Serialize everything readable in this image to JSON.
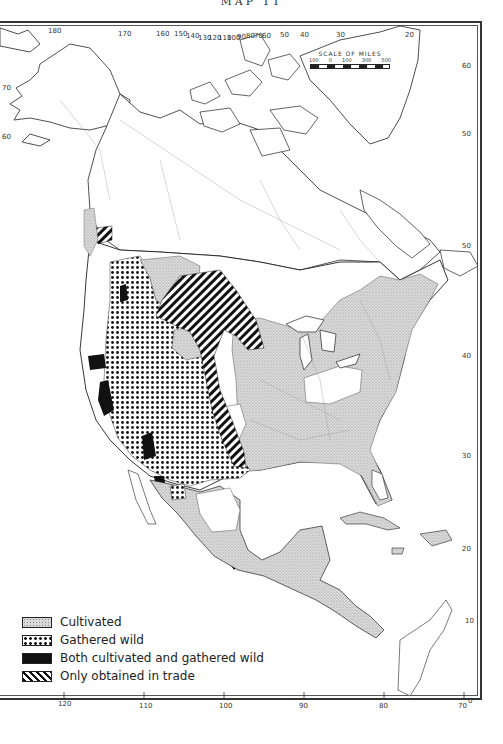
{
  "map": {
    "title": "MAP 11",
    "scale": {
      "title": "SCALE OF MILES",
      "labels": [
        "100",
        "0",
        "100",
        "300",
        "500"
      ]
    },
    "legend": {
      "items": [
        {
          "label": "Cultivated",
          "pattern": "fine-stipple"
        },
        {
          "label": "Gathered wild",
          "pattern": "coarse-dots"
        },
        {
          "label": "Both cultivated and gathered wild",
          "pattern": "solid-black"
        },
        {
          "label": "Only obtained in trade",
          "pattern": "diagonal-hatch"
        }
      ]
    },
    "longitude_top": [
      "180",
      "170",
      "160",
      "150",
      "140",
      "130",
      "120",
      "110",
      "100",
      "90",
      "80",
      "70",
      "60",
      "50",
      "40",
      "30",
      "20"
    ],
    "longitude_bottom": [
      "120",
      "110",
      "100",
      "90",
      "80",
      "70"
    ],
    "latitude_right": [
      "60",
      "50",
      "40",
      "50",
      "40",
      "30",
      "20",
      "10",
      "0"
    ],
    "latitude_left": [
      "70",
      "60"
    ],
    "colors": {
      "ink": "#1a1a1a",
      "stipple_fill": "#d6d6d6",
      "boundary": "#9a9a9a",
      "background": "#ffffff"
    }
  }
}
